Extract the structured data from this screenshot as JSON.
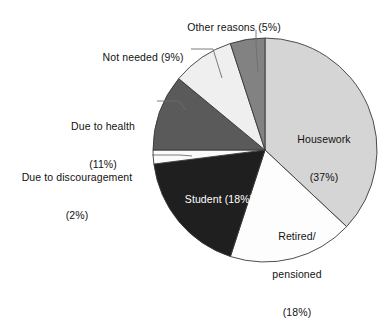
{
  "chart_data": {
    "type": "pie",
    "title": "",
    "subtitle": "",
    "xlabel": "",
    "ylabel": "",
    "legend_position": "none",
    "grid": false,
    "units": "percent",
    "start_angle_deg": 0,
    "direction": "clockwise",
    "categories": [
      "Housework",
      "Retired/pensioned",
      "Student",
      "Due to discouragement",
      "Due to health",
      "Not needed",
      "Other reasons"
    ],
    "values": [
      37,
      18,
      18,
      2,
      11,
      9,
      5
    ],
    "slices": [
      {
        "name": "Housework",
        "value": 37,
        "label_lines": [
          "Housework",
          "(37%)"
        ],
        "label_placement": "inside",
        "fill": "#d5d5d5",
        "text_color": "#121212"
      },
      {
        "name": "Retired/pensioned",
        "value": 18,
        "label_lines": [
          "Retired/",
          "pensioned",
          "(18%)"
        ],
        "label_placement": "inside",
        "fill": "#fdfdfd",
        "text_color": "#121212"
      },
      {
        "name": "Student",
        "value": 18,
        "label_lines": [
          "Student (18%)"
        ],
        "label_placement": "inside",
        "fill": "#1f1f1f",
        "text_color": "#ffffff"
      },
      {
        "name": "Due to discouragement",
        "value": 2,
        "label_lines": [
          "Due to discouragement",
          "(2%)"
        ],
        "label_placement": "outside-left",
        "fill": "#fbfbfb",
        "text_color": "#121212"
      },
      {
        "name": "Due to health",
        "value": 11,
        "label_lines": [
          "Due to health",
          "(11%)"
        ],
        "label_placement": "outside-left",
        "fill": "#5a5a5a",
        "text_color": "#121212"
      },
      {
        "name": "Not needed",
        "value": 9,
        "label_lines": [
          "Not needed (9%)"
        ],
        "label_placement": "outside-left",
        "fill": "#efefef",
        "text_color": "#121212"
      },
      {
        "name": "Other reasons",
        "value": 5,
        "label_lines": [
          "Other reasons (5%)"
        ],
        "label_placement": "outside-top",
        "fill": "#828282",
        "text_color": "#121212"
      }
    ]
  },
  "labels": {
    "other_reasons": "Other reasons (5%)",
    "not_needed": "Not needed (9%)",
    "due_health_line1": "Due to health",
    "due_health_line2": "(11%)",
    "due_discouragement_line1": "Due to discouragement",
    "due_discouragement_line2": "(2%)",
    "housework_line1": "Housework",
    "housework_line2": "(37%)",
    "retired_line1": "Retired/",
    "retired_line2": "pensioned",
    "retired_line3": "(18%)",
    "student": "Student (18%)"
  },
  "colors": {
    "housework": "#d5d5d5",
    "retired": "#fdfdfd",
    "student": "#1f1f1f",
    "discouragement": "#fbfbfb",
    "health": "#5a5a5a",
    "not_needed": "#efefef",
    "other_reasons": "#828282",
    "outline": "#3a3a3a",
    "leader": "#6d6d6d",
    "background": "#ffffff"
  }
}
